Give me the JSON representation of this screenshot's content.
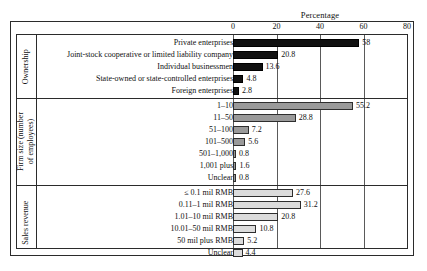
{
  "chart_data": {
    "type": "bar",
    "orientation": "horizontal",
    "title": "",
    "xlabel": "Percentage",
    "ylabel": "",
    "xlim": [
      0,
      80
    ],
    "xticks": [
      0,
      20,
      40,
      60,
      80
    ],
    "xtick_labels": [
      "0",
      "20",
      "40",
      "60",
      "80"
    ],
    "grid": true,
    "legend": "none",
    "groups": [
      {
        "name": "Ownership",
        "color": "#111111",
        "categories": [
          "Private enterprises",
          "Joint-stock cooperative or limited liability company",
          "Individual businessmen",
          "State-owned or state-controlled enterprises",
          "Foreign enterprises"
        ],
        "values": [
          58,
          20.8,
          13.6,
          4.8,
          2.8
        ],
        "value_labels": [
          "58",
          "20.8",
          "13.6",
          "4.8",
          "2.8"
        ]
      },
      {
        "name": "Firm size (number of employees)",
        "name_lines": [
          "Firm size (number",
          "of employees)"
        ],
        "color": "#9a9a9a",
        "categories": [
          "1–10",
          "11–50",
          "51–100",
          "101–500",
          "501–1,000",
          "1,001 plus",
          "Unclear"
        ],
        "values": [
          55.2,
          28.8,
          7.2,
          5.6,
          0.8,
          1.6,
          0.8
        ],
        "value_labels": [
          "55.2",
          "28.8",
          "7.2",
          "5.6",
          "0.8",
          "1.6",
          "0.8"
        ]
      },
      {
        "name": "Sales revenue",
        "color": "#dcdcdc",
        "categories": [
          "≤ 0.1 mil RMB",
          "0.11–1 mil RMB",
          "1.01–10 mil RMB",
          "10.01–50 mil RMB",
          "50 mil plus RMB",
          "Unclear"
        ],
        "values": [
          27.6,
          31.2,
          20.8,
          10.8,
          5.2,
          4.4
        ],
        "value_labels": [
          "27.6",
          "31.2",
          "20.8",
          "10.8",
          "5.2",
          "4.4"
        ]
      }
    ]
  }
}
